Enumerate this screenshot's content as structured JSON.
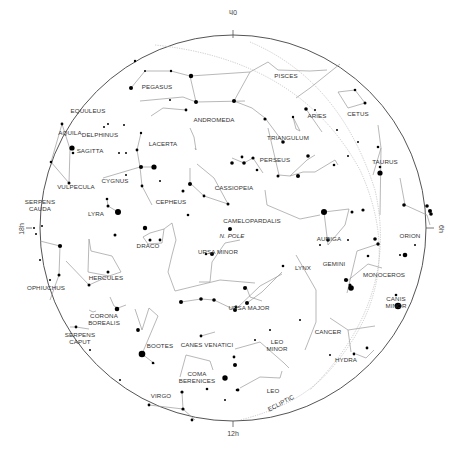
{
  "chart": {
    "center": [
      233,
      226
    ],
    "radius": 193,
    "colors": {
      "horizon": "#555555",
      "lines": "#9a9a9a",
      "stars": "#000000",
      "labels": "#333333",
      "ecliptic": "#b5b5b5"
    },
    "hour_labels": [
      {
        "text": "0h",
        "x": 233,
        "y": 12,
        "rotate": 180
      },
      {
        "text": "6h",
        "x": 441,
        "y": 229,
        "rotate": 90
      },
      {
        "text": "12h",
        "x": 233,
        "y": 434,
        "rotate": 0
      },
      {
        "text": "18h",
        "x": 22,
        "y": 229,
        "rotate": -90
      }
    ],
    "pole_label": "N. POLE",
    "ecliptic_label": "ECLIPTIC",
    "constellations": [
      {
        "name": "PISCES",
        "x": 286,
        "y": 78
      },
      {
        "name": "PEGASUS",
        "x": 157,
        "y": 89
      },
      {
        "name": "EQUULEUS",
        "x": 88,
        "y": 113
      },
      {
        "name": "CETUS",
        "x": 358,
        "y": 116
      },
      {
        "name": "ARIES",
        "x": 317,
        "y": 118
      },
      {
        "name": "ANDROMEDA",
        "x": 214,
        "y": 122
      },
      {
        "name": "AQUILA",
        "x": 70,
        "y": 135
      },
      {
        "name": "DELPHINUS",
        "x": 100,
        "y": 137
      },
      {
        "name": "TRIANGULUM",
        "x": 288,
        "y": 140
      },
      {
        "name": "LACERTA",
        "x": 163,
        "y": 146
      },
      {
        "name": "SAGITTA",
        "x": 90,
        "y": 153
      },
      {
        "name": "PERSEUS",
        "x": 275,
        "y": 162
      },
      {
        "name": "TAURUS",
        "x": 385,
        "y": 164
      },
      {
        "name": "CYGNUS",
        "x": 115,
        "y": 183
      },
      {
        "name": "VULPECULA",
        "x": 76,
        "y": 189
      },
      {
        "name": "CASSIOPEIA",
        "x": 234,
        "y": 190
      },
      {
        "name": "SERPENS",
        "x": 40,
        "y": 204
      },
      {
        "name": "CAUDA",
        "x": 40,
        "y": 211
      },
      {
        "name": "CEPHEUS",
        "x": 171,
        "y": 204
      },
      {
        "name": "LYRA",
        "x": 96,
        "y": 216
      },
      {
        "name": "CAMELOPARDALIS",
        "x": 252,
        "y": 223
      },
      {
        "name": "AURIGA",
        "x": 329,
        "y": 241
      },
      {
        "name": "ORION",
        "x": 410,
        "y": 238
      },
      {
        "name": "DRACO",
        "x": 148,
        "y": 248
      },
      {
        "name": "URSA MINOR",
        "x": 218,
        "y": 254
      },
      {
        "name": "GEMINI",
        "x": 334,
        "y": 266
      },
      {
        "name": "MONOCEROS",
        "x": 384,
        "y": 277
      },
      {
        "name": "LYNX",
        "x": 303,
        "y": 270
      },
      {
        "name": "HERCULES",
        "x": 106,
        "y": 280
      },
      {
        "name": "OPHIUCHUS",
        "x": 46,
        "y": 290
      },
      {
        "name": "CANIS",
        "x": 396,
        "y": 301
      },
      {
        "name": "MINOR",
        "x": 396,
        "y": 308
      },
      {
        "name": "CORONA",
        "x": 104,
        "y": 318
      },
      {
        "name": "BOREALIS",
        "x": 104,
        "y": 325
      },
      {
        "name": "URSA MAJOR",
        "x": 249,
        "y": 310
      },
      {
        "name": "CANCER",
        "x": 328,
        "y": 334
      },
      {
        "name": "SERPENS",
        "x": 80,
        "y": 337
      },
      {
        "name": "CAPUT",
        "x": 80,
        "y": 344
      },
      {
        "name": "LEO",
        "x": 277,
        "y": 344
      },
      {
        "name": "MINOR",
        "x": 277,
        "y": 351
      },
      {
        "name": "BOOTES",
        "x": 160,
        "y": 348
      },
      {
        "name": "CANES VENATICI",
        "x": 207,
        "y": 347
      },
      {
        "name": "HYDRA",
        "x": 346,
        "y": 362
      },
      {
        "name": "COMA",
        "x": 197,
        "y": 376
      },
      {
        "name": "BERENICES",
        "x": 197,
        "y": 383
      },
      {
        "name": "LEO",
        "x": 273,
        "y": 393
      },
      {
        "name": "VIRGO",
        "x": 161,
        "y": 398
      }
    ]
  }
}
